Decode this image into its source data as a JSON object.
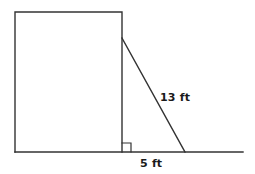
{
  "figure": {
    "type": "geometry-diagram",
    "background_color": "#ffffff",
    "stroke_color": "#333333",
    "text_color": "#1a1a1a",
    "labels": {
      "hypotenuse": "13 ft",
      "base": "5 ft"
    },
    "shapes": {
      "wall_rectangle": {
        "name": "wall-rectangle",
        "x1": 15,
        "y1": 12,
        "x2": 122,
        "y2": 152,
        "fill": "none",
        "stroke_width": 1.4
      },
      "ground_line": {
        "name": "ground-line",
        "x1": 15,
        "y1": 152,
        "x2": 243,
        "y2": 152,
        "stroke_width": 1.4
      },
      "ladder_line": {
        "name": "ladder-hypotenuse-line",
        "x1": 122,
        "y1": 38,
        "x2": 185,
        "y2": 152,
        "stroke_width": 1.4
      },
      "right_angle_marker": {
        "name": "right-angle-marker",
        "x": 122,
        "y": 143,
        "size": 9,
        "stroke_width": 1.2
      }
    },
    "measurements": {
      "hypotenuse_value": 13,
      "hypotenuse_unit": "ft",
      "base_value": 5,
      "base_unit": "ft"
    }
  }
}
